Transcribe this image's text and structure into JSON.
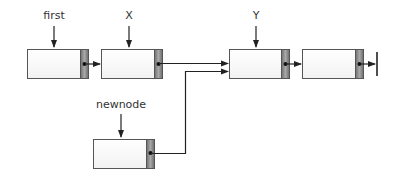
{
  "diagram": {
    "type": "linked-list-insertion",
    "labels": {
      "first": "first",
      "x": "X",
      "y": "Y",
      "newnode": "newnode"
    },
    "nodes": [
      {
        "id": "node-first",
        "pointer": "first"
      },
      {
        "id": "node-x",
        "pointer": "X"
      },
      {
        "id": "node-y",
        "pointer": "Y"
      },
      {
        "id": "node-last",
        "pointer": "",
        "next": "null"
      },
      {
        "id": "node-new",
        "pointer": "newnode"
      }
    ],
    "colors": {
      "box_fill": "#fcfcfc",
      "box_border": "#555555",
      "pointer_fill": "#8a8a8a",
      "line": "#333333"
    }
  }
}
